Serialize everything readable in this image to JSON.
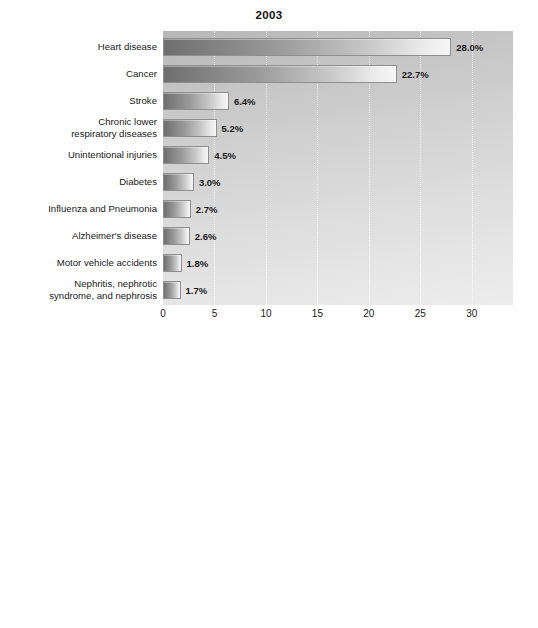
{
  "chart_data": [
    {
      "type": "bar",
      "orientation": "horizontal",
      "title": "2003",
      "xlabel": "",
      "ylabel": "",
      "xlim": [
        0,
        34
      ],
      "grid": true,
      "legend": "none",
      "xticks": [
        0,
        5,
        10,
        15,
        20,
        25,
        30
      ],
      "xtick_labels": [
        "0",
        "5",
        "10",
        "15",
        "20",
        "25",
        "30"
      ],
      "categories": [
        "Heart disease",
        "Cancer",
        "Stroke",
        "Chronic lower respiratory diseases",
        "Unintentional injuries",
        "Diabetes",
        "Influenza and Pneumonia",
        "Alzheimer's disease",
        "Motor vehicle accidents",
        "Nephritis, nephrotic syndrome, and nephrosis"
      ],
      "category_lines": [
        [
          "Heart disease"
        ],
        [
          "Cancer"
        ],
        [
          "Stroke"
        ],
        [
          "Chronic lower",
          "respiratory diseases"
        ],
        [
          "Unintentional injuries"
        ],
        [
          "Diabetes"
        ],
        [
          "Influenza and Pneumonia"
        ],
        [
          "Alzheimer's disease"
        ],
        [
          "Motor vehicle accidents"
        ],
        [
          "Nephritis, nephrotic",
          "syndrome, and nephrosis"
        ]
      ],
      "values": [
        28.0,
        22.7,
        6.4,
        5.2,
        4.5,
        3.0,
        2.7,
        2.6,
        1.8,
        1.7
      ],
      "value_labels": [
        "28.0%",
        "22.7%",
        "6.4%",
        "5.2%",
        "4.5%",
        "3.0%",
        "2.7%",
        "2.6%",
        "1.8%",
        "1.7%"
      ]
    },
    {
      "type": "bar",
      "orientation": "horizontal",
      "title": "1900",
      "xlabel": "",
      "ylabel": "",
      "xlim": [
        0,
        29.5
      ],
      "grid": true,
      "legend": "none",
      "xticks": [
        0,
        5,
        10,
        15,
        20,
        25
      ],
      "xtick_labels": [
        "0",
        "5",
        "10",
        "15",
        "20",
        "25"
      ],
      "categories": [
        "Pneumonia",
        "Tuberculosis",
        "Diarrhea and enteritis",
        "Heart disease",
        "Liver disease",
        "Injuries",
        "Cancer",
        "Senility",
        "Diphtheria"
      ],
      "category_lines": [
        [
          "Pneumonia"
        ],
        [
          "Tuberculosis"
        ],
        [
          "Diarrhea and",
          "enteritis"
        ],
        [
          "Heart disease"
        ],
        [
          "Liver disease"
        ],
        [
          "Injuries"
        ],
        [
          "Cancer"
        ],
        [
          "Senility"
        ],
        [
          "Diphtheria"
        ]
      ],
      "values": [
        11.8,
        11.3,
        8.3,
        6.2,
        5.2,
        4.2,
        3.7,
        2.9,
        2.3
      ],
      "value_labels": [
        "11.8%",
        "11.3%",
        "8.3%",
        "6.2%",
        "5.2%",
        "4.2%",
        "3.7%",
        "2.9%",
        "2.3%"
      ]
    }
  ],
  "colors": {
    "bar_dark": "#6e6e6e",
    "bar_light": "#f6f6f6",
    "bar_border": "#8f8f8f",
    "plot_background_top": "#b6b6b6",
    "plot_background_bottom": "#ececec",
    "text": "#1a1a1a",
    "gridline": "#ffffff"
  }
}
